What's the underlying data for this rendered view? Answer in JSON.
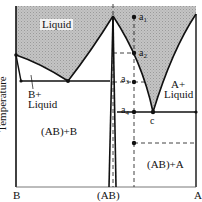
{
  "figure": {
    "type": "phase-diagram"
  },
  "axes": {
    "ylabel": "Temperature",
    "x_ticks": [
      "B",
      "(AB)",
      "A"
    ]
  },
  "regions": {
    "liquid": "Liquid",
    "b_liquid_line1": "B+",
    "b_liquid_line2": "Liquid",
    "ab_b": "(AB)+B",
    "a_liquid_line1": "A+",
    "a_liquid_line2": "Liquid",
    "ab_a": "(AB)+A"
  },
  "points": {
    "a1": "a",
    "a1_sub": "1",
    "a2": "a",
    "a2_sub": "2",
    "a3": "a",
    "a3_sub": "3",
    "a4": "a",
    "a4_sub": "4",
    "eutectic_c": "c"
  },
  "colors": {
    "liquid_fill": "#bdbdbd",
    "lines": "#111111"
  }
}
